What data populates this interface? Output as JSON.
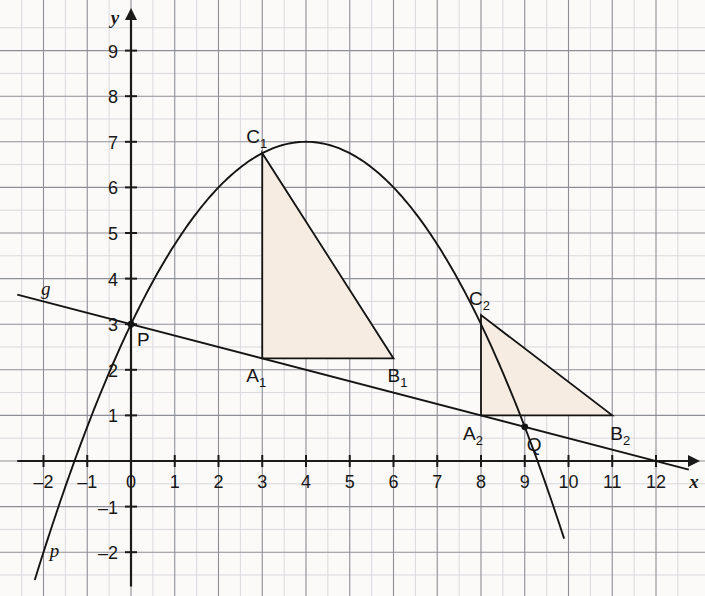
{
  "figure": {
    "background_color": "#fbfaf8",
    "grid": {
      "minor_color": "#d9d9de",
      "major_color": "#8e8e96",
      "minor_step": 0.5,
      "major_step": 1,
      "x_range": [
        -2.6,
        12.9
      ],
      "y_range": [
        -2.75,
        9.9
      ]
    },
    "axis_color": "#1a1a1a"
  },
  "chart_data": {
    "type": "line",
    "title": "",
    "xlabel": "x",
    "ylabel": "y",
    "xlim": [
      -2.6,
      12.9
    ],
    "ylim": [
      -2.75,
      9.9
    ],
    "grid": true,
    "x_ticks": [
      -2,
      -1,
      0,
      1,
      2,
      3,
      4,
      5,
      6,
      7,
      8,
      9,
      10,
      11,
      12
    ],
    "y_ticks": [
      -2,
      -1,
      1,
      2,
      3,
      4,
      5,
      6,
      7,
      8,
      9
    ],
    "x_tick_labels": [
      "-2",
      "-1",
      "0",
      "1",
      "2",
      "3",
      "4",
      "5",
      "6",
      "7",
      "8",
      "9",
      "10",
      "11",
      "12"
    ],
    "y_tick_labels": [
      "-2",
      "-1",
      "1",
      "2",
      "3",
      "4",
      "5",
      "6",
      "7",
      "8",
      "9"
    ],
    "origin_label": "0",
    "series": [
      {
        "name": "p",
        "kind": "parabola",
        "label": "p",
        "color": "#141414",
        "vertex": [
          4,
          7
        ],
        "a": -0.25,
        "equation": "y = -0.25(x - 4)^2 + 7",
        "label_position": [
          -1.75,
          -2.1
        ],
        "x_from": -2.2,
        "x_to": 9.9
      },
      {
        "name": "g",
        "kind": "line",
        "label": "g",
        "color": "#141414",
        "slope": -0.25,
        "intercept": 3,
        "equation": "y = 3 - 0.25x",
        "label_position": [
          -1.95,
          3.65
        ],
        "x_from": -2.6,
        "x_to": 12.75
      }
    ],
    "points": [
      {
        "name": "P",
        "label": "P",
        "x": 0,
        "y": 3,
        "marker": true,
        "label_dx": 6,
        "label_dy": 22
      },
      {
        "name": "Q",
        "label": "Q",
        "x": 9,
        "y": 0.75,
        "marker": true,
        "label_dx": 2,
        "label_dy": 24
      },
      {
        "name": "A1",
        "label": "A",
        "sub": "1",
        "x": 3,
        "y": 2.25,
        "marker": false,
        "label_dx": -16,
        "label_dy": 24
      },
      {
        "name": "B1",
        "label": "B",
        "sub": "1",
        "x": 6,
        "y": 2.25,
        "marker": false,
        "label_dx": -6,
        "label_dy": 24
      },
      {
        "name": "C1",
        "label": "C",
        "sub": "1",
        "x": 3,
        "y": 6.75,
        "marker": false,
        "label_dx": -16,
        "label_dy": -10
      },
      {
        "name": "A2",
        "label": "A",
        "sub": "2",
        "x": 8,
        "y": 1,
        "marker": false,
        "label_dx": -18,
        "label_dy": 25
      },
      {
        "name": "B2",
        "label": "B",
        "sub": "2",
        "x": 11,
        "y": 1,
        "marker": false,
        "label_dx": -2,
        "label_dy": 25
      },
      {
        "name": "C2",
        "label": "C",
        "sub": "2",
        "x": 8,
        "y": 3.2,
        "marker": false,
        "label_dx": -12,
        "label_dy": -10
      }
    ],
    "polygons": [
      {
        "name": "triangle-1",
        "vertices": [
          [
            3,
            2.25
          ],
          [
            6,
            2.25
          ],
          [
            3,
            6.75
          ]
        ],
        "fill": "#f6ece1",
        "stroke": "#141414"
      },
      {
        "name": "triangle-2",
        "vertices": [
          [
            8,
            1
          ],
          [
            11,
            1
          ],
          [
            8,
            3.2
          ]
        ],
        "fill": "#f6ece1",
        "stroke": "#141414"
      }
    ]
  }
}
